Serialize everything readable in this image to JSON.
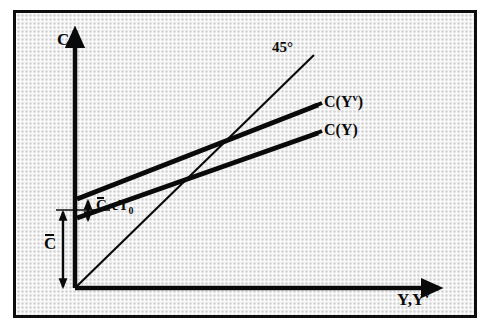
{
  "figure": {
    "kind": "economics-consumption-function-diagram",
    "background_color": "#ececec",
    "border_color": "#0d0d0d",
    "ink_color": "#0a0a0a"
  },
  "axes": {
    "vertical_label": "C",
    "horizontal_label_prefix": "Y,Y",
    "horizontal_label_superscript": "v",
    "origin": {
      "x": 75,
      "y": 288
    }
  },
  "lines": {
    "reference_45": {
      "label": "45°",
      "from": {
        "x": 75,
        "y": 288
      },
      "to": {
        "x": 314,
        "y": 55
      },
      "stroke_width": 2
    },
    "consumption_disposable": {
      "label_prefix": "C(Y",
      "label_superscript": "v",
      "label_suffix": ")",
      "from": {
        "x": 77,
        "y": 199
      },
      "to": {
        "x": 318,
        "y": 105
      },
      "stroke_width": 5
    },
    "consumption_gross": {
      "label": "C(Y)",
      "from": {
        "x": 77,
        "y": 218
      },
      "to": {
        "x": 318,
        "y": 133
      },
      "stroke_width": 5
    }
  },
  "annotations": {
    "autonomous_consumption": {
      "label_letter": "C",
      "overbar": true,
      "arrow_from": {
        "x": 63,
        "y": 211
      },
      "arrow_to": {
        "x": 63,
        "y": 288
      }
    },
    "intercept_gap": {
      "label_prefix": "C",
      "label_suffix": "-cT",
      "label_subscript": "0",
      "overbar": true,
      "arrow_from": {
        "x": 88,
        "y": 200
      },
      "arrow_to": {
        "x": 88,
        "y": 221
      }
    }
  }
}
